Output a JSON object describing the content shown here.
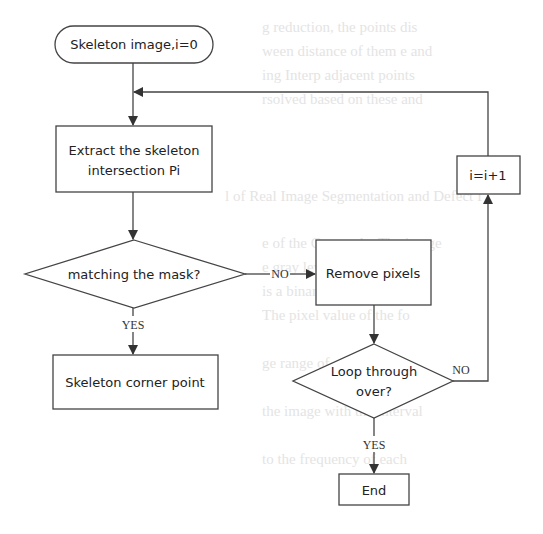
{
  "flowchart": {
    "nodes": {
      "start": {
        "type": "terminator",
        "label": "Skeleton image,i=0"
      },
      "extract": {
        "type": "process",
        "line1": "Extract the skeleton",
        "line2": "intersection Pi"
      },
      "match": {
        "type": "decision",
        "label": "matching the mask?"
      },
      "corner": {
        "type": "process",
        "label": "Skeleton corner point"
      },
      "remove": {
        "type": "process",
        "label": "Remove pixels"
      },
      "loop": {
        "type": "decision",
        "line1": "Loop through",
        "line2": "over?"
      },
      "increment": {
        "type": "process",
        "label": "i=i+1"
      },
      "end": {
        "type": "process",
        "label": "End"
      }
    },
    "edges": [
      {
        "from": "start",
        "to": "extract",
        "label": ""
      },
      {
        "from": "extract",
        "to": "match",
        "label": ""
      },
      {
        "from": "match",
        "to": "corner",
        "label": "YES"
      },
      {
        "from": "match",
        "to": "remove",
        "label": "NO"
      },
      {
        "from": "remove",
        "to": "loop",
        "label": ""
      },
      {
        "from": "loop",
        "to": "end",
        "label": "YES"
      },
      {
        "from": "loop",
        "to": "increment",
        "label": "NO"
      },
      {
        "from": "increment",
        "to": "extract",
        "label": ""
      }
    ],
    "edge_labels": {
      "match_yes": "YES",
      "match_no": "NO",
      "loop_yes": "YES",
      "loop_no": "NO"
    }
  },
  "background_text": [
    "g reduction, the points dis",
    "ween distance of them e and",
    "ing Interp  adjacent points",
    "rsolved based on these and",
    "l of Real Image Segmentation and Defect I",
    "e of the Grayscale. The image",
    "e gray level domain to the",
    "is a binary information with",
    "The pixel value of the fo",
    "ge range of   , and a   ",
    "the image with the interval",
    "to the frequency of each"
  ]
}
